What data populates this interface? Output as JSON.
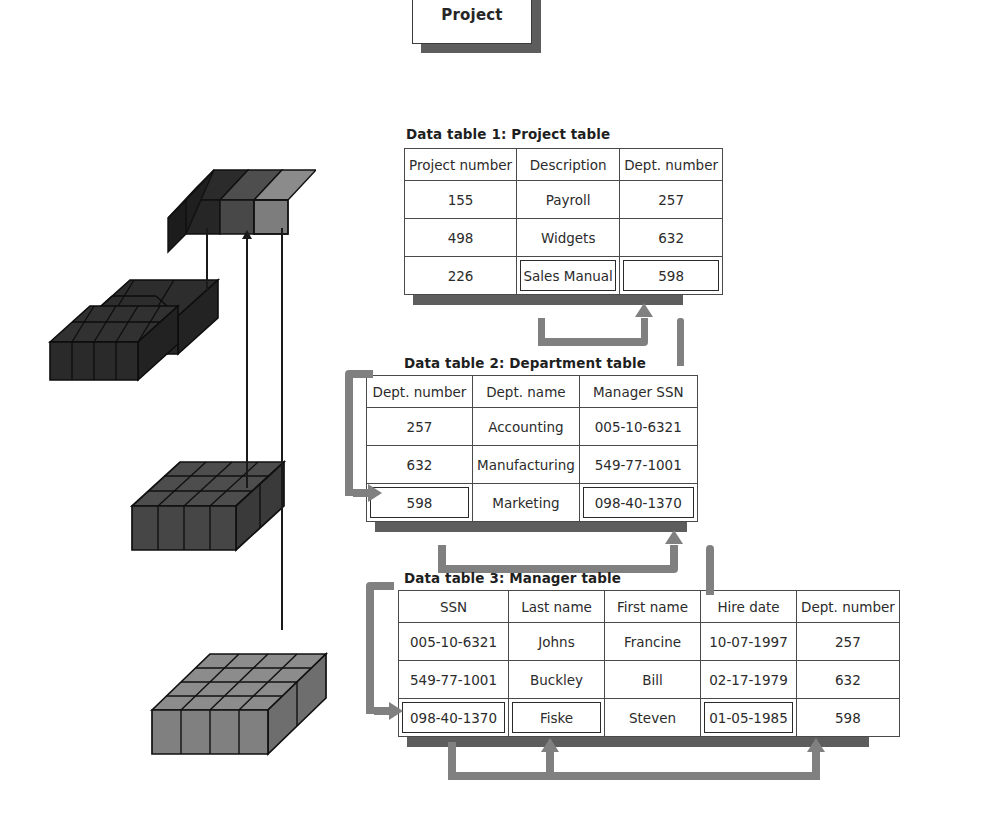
{
  "diagram": {
    "title_box": {
      "label": "Project"
    },
    "captions": {
      "t1": "Data table 1: Project table",
      "t2": "Data table 2: Department table",
      "t3": "Data table 3: Manager table"
    },
    "colors": {
      "connector": "#808080",
      "table_border": "#4a4a4a",
      "shadow": "#5d5d5d",
      "cube_dark": "#2b2b2b",
      "cube_mid": "#4a4a4a",
      "cube_light": "#7d7d7d",
      "background": "#ffffff"
    },
    "cube_stacks": [
      {
        "name": "legend-row",
        "shade": "mixed",
        "cols": 3,
        "rows": 1
      },
      {
        "name": "stack-dark",
        "shade": "#2b2b2b",
        "cols": 4,
        "rows": 3
      },
      {
        "name": "stack-mid",
        "shade": "#4a4a4a",
        "cols": 4,
        "rows": 3
      },
      {
        "name": "stack-light",
        "shade": "#7d7d7d",
        "cols": 4,
        "rows": 4
      }
    ]
  },
  "tables": {
    "project": {
      "caption": "Data table 1: Project table",
      "columns": [
        "Project number",
        "Description",
        "Dept. number"
      ],
      "rows": [
        [
          "155",
          "Payroll",
          "257"
        ],
        [
          "498",
          "Widgets",
          "632"
        ],
        [
          "226",
          "Sales Manual",
          "598"
        ]
      ],
      "highlighted": [
        [
          2,
          1
        ],
        [
          2,
          2
        ]
      ]
    },
    "department": {
      "caption": "Data table 2: Department table",
      "columns": [
        "Dept. number",
        "Dept. name",
        "Manager SSN"
      ],
      "rows": [
        [
          "257",
          "Accounting",
          "005-10-6321"
        ],
        [
          "632",
          "Manufacturing",
          "549-77-1001"
        ],
        [
          "598",
          "Marketing",
          "098-40-1370"
        ]
      ],
      "highlighted": [
        [
          2,
          0
        ],
        [
          2,
          2
        ]
      ]
    },
    "manager": {
      "caption": "Data table 3: Manager table",
      "columns": [
        "SSN",
        "Last name",
        "First name",
        "Hire date",
        "Dept. number"
      ],
      "rows": [
        [
          "005-10-6321",
          "Johns",
          "Francine",
          "10-07-1997",
          "257"
        ],
        [
          "549-77-1001",
          "Buckley",
          "Bill",
          "02-17-1979",
          "632"
        ],
        [
          "098-40-1370",
          "Fiske",
          "Steven",
          "01-05-1985",
          "598"
        ]
      ],
      "highlighted": [
        [
          2,
          0
        ],
        [
          2,
          1
        ],
        [
          2,
          3
        ]
      ]
    }
  }
}
